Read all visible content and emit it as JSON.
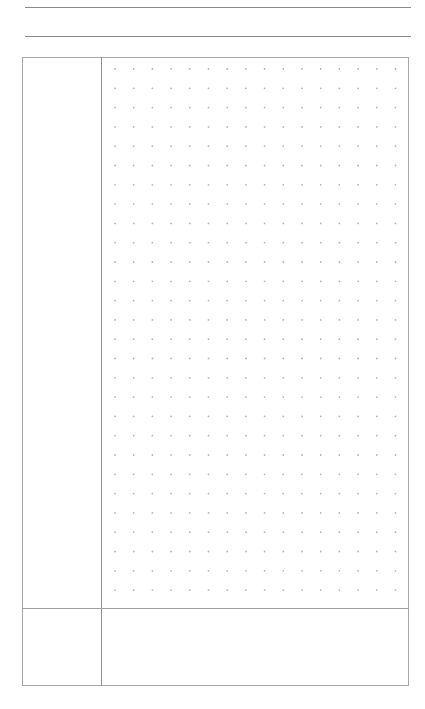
{
  "page": {
    "type": "dotted-planner-page",
    "background_color": "#ffffff",
    "line_color": "#8a8a8a",
    "dot_color": "#b4b4b4"
  },
  "header": {
    "lines": [
      {
        "y": 7,
        "label": ""
      },
      {
        "y": 36,
        "label": ""
      }
    ]
  },
  "grid_section": {
    "sidebar_label": "",
    "dot_grid": {
      "columns": 16,
      "rows": 28,
      "x_start": 115,
      "y_start": 69,
      "x_step": 18.7,
      "y_step": 19.3
    }
  },
  "notes_section": {
    "sidebar_label": "",
    "content": ""
  }
}
